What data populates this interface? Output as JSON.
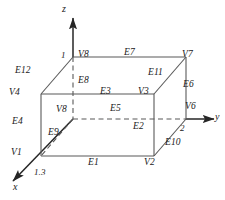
{
  "figure": {
    "type": "3d-box-wireframe-diagram",
    "colors": {
      "line": "#4d4d4d",
      "axis": "#262626",
      "text": "#1a1a1a",
      "background": "#ffffff"
    }
  },
  "axes": {
    "x_label": "x",
    "y_label": "y",
    "z_label": "z",
    "tick_x": "1.3",
    "tick_y": "2",
    "tick_z": "1"
  },
  "vertices": [
    {
      "id": "v1",
      "label": "V1"
    },
    {
      "id": "v2",
      "label": "V2"
    },
    {
      "id": "v3",
      "label": "V3"
    },
    {
      "id": "v4",
      "label": "V4"
    },
    {
      "id": "v6",
      "label": "V6"
    },
    {
      "id": "v7",
      "label": "V7"
    },
    {
      "id": "v8_top",
      "label": "V8"
    },
    {
      "id": "v8_back",
      "label": "V8"
    }
  ],
  "edges": [
    {
      "id": "e1",
      "label": "E1"
    },
    {
      "id": "e2",
      "label": "E2"
    },
    {
      "id": "e3",
      "label": "E3"
    },
    {
      "id": "e4",
      "label": "E4"
    },
    {
      "id": "e5",
      "label": "E5"
    },
    {
      "id": "e6",
      "label": "E6"
    },
    {
      "id": "e7",
      "label": "E7"
    },
    {
      "id": "e8",
      "label": "E8"
    },
    {
      "id": "e9",
      "label": "E9"
    },
    {
      "id": "e10",
      "label": "E10"
    },
    {
      "id": "e11",
      "label": "E11"
    },
    {
      "id": "e12",
      "label": "E12"
    }
  ]
}
